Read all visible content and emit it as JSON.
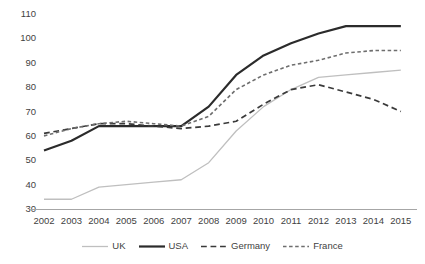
{
  "chart_data": {
    "type": "line",
    "title": "",
    "xlabel": "",
    "ylabel": "",
    "grid": false,
    "legend_position": "bottom",
    "ylim": [
      30,
      110
    ],
    "ytick_step": 10,
    "yticks": [
      110,
      100,
      90,
      80,
      70,
      60,
      50,
      40,
      30
    ],
    "categories": [
      2002,
      2003,
      2004,
      2005,
      2006,
      2007,
      2008,
      2009,
      2010,
      2011,
      2012,
      2013,
      2014,
      2015
    ],
    "xticks": [
      "2002",
      "2003",
      "2004",
      "2005",
      "2006",
      "2007",
      "2008",
      "2009",
      "2010",
      "2011",
      "2012",
      "2013",
      "2014",
      "2015"
    ],
    "series": [
      {
        "name": "UK",
        "color": "#bfbfbf",
        "style": "solid",
        "width": 1.3,
        "values": [
          34,
          34,
          39,
          40,
          41,
          42,
          49,
          62,
          72,
          79,
          84,
          85,
          86,
          87
        ]
      },
      {
        "name": "USA",
        "color": "#2b2b2b",
        "style": "solid",
        "width": 2.2,
        "values": [
          54,
          58,
          64,
          64,
          64,
          64,
          72,
          85,
          93,
          98,
          102,
          105,
          105,
          105
        ]
      },
      {
        "name": "Germany",
        "color": "#3a3a3a",
        "style": "dashed",
        "width": 1.7,
        "values": [
          61,
          63,
          65,
          65,
          64,
          63,
          64,
          66,
          73,
          79,
          81,
          78,
          75,
          70
        ]
      },
      {
        "name": "France",
        "color": "#6e6e6e",
        "style": "dotted",
        "width": 1.6,
        "values": [
          60,
          63,
          65,
          66,
          65,
          64,
          68,
          79,
          85,
          89,
          91,
          94,
          95,
          95
        ]
      }
    ]
  },
  "legend": {
    "items": [
      {
        "label": "UK"
      },
      {
        "label": "USA"
      },
      {
        "label": "Germany"
      },
      {
        "label": "France"
      }
    ]
  }
}
